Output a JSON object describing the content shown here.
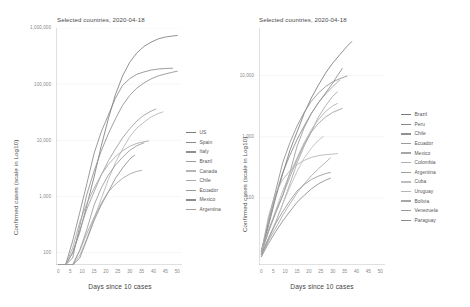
{
  "charts": [
    {
      "id": "left",
      "title": "Selected countries, 2020-04-18",
      "ylabel": "Confirmed cases (scale in Log10)",
      "xlabel": "Days since 10 cases",
      "legend_labels": [
        "US",
        "Spain",
        "Italy",
        "Brazil",
        "Canada",
        "Chile",
        "Ecuador",
        "Mexico",
        "Argentina"
      ]
    },
    {
      "id": "right",
      "title": "Selected countries, 2020-04-18",
      "ylabel": "Confirmed cases (scale in Log10)",
      "xlabel": "Days since 10 cases",
      "legend_labels": [
        "Brazil",
        "Peru",
        "Chile",
        "Ecuador",
        "Mexico",
        "Colombia",
        "Argentina",
        "Cuba",
        "Uruguay",
        "Bolivia",
        "Venezuela",
        "Paraguay"
      ]
    }
  ],
  "chart_data": [
    {
      "type": "line",
      "title": "Selected countries, 2020-04-18",
      "xlabel": "Days since 10 cases",
      "ylabel": "Confirmed cases (scale in Log10)",
      "yscale": "log10",
      "ylim": [
        60,
        1000000
      ],
      "xlim": [
        -1,
        52
      ],
      "ytick_labels": [
        "1,000,000",
        "100,000",
        "10,000",
        "1,000",
        "100"
      ],
      "ytick_values": [
        1000000,
        100000,
        10000,
        1000,
        100
      ],
      "xtick_labels": [
        "0",
        "5",
        "10",
        "15",
        "20",
        "25",
        "30",
        "35",
        "40",
        "45",
        "50"
      ],
      "xtick_values": [
        0,
        5,
        10,
        15,
        20,
        25,
        30,
        35,
        40,
        45,
        50
      ],
      "grid": true,
      "legend_position": "right",
      "series": [
        {
          "name": "US",
          "color": "#7d7d7d",
          "x": [
            0,
            3,
            6,
            9,
            12,
            15,
            18,
            21,
            24,
            27,
            30,
            33,
            36,
            39,
            42,
            45,
            48,
            50
          ],
          "y": [
            13,
            35,
            98,
            230,
            700,
            2200,
            7800,
            24000,
            65000,
            140000,
            245000,
            360000,
            470000,
            560000,
            640000,
            690000,
            720000,
            735000
          ]
        },
        {
          "name": "Spain",
          "color": "#8a8a8a",
          "x": [
            0,
            3,
            6,
            9,
            12,
            15,
            18,
            21,
            24,
            27,
            30,
            33,
            36,
            39,
            42,
            45,
            48
          ],
          "y": [
            13,
            45,
            160,
            520,
            1700,
            5800,
            14000,
            28000,
            56000,
            95000,
            125000,
            150000,
            165000,
            178000,
            186000,
            190000,
            192000
          ]
        },
        {
          "name": "Italy",
          "color": "#8f8f8f",
          "x": [
            0,
            3,
            6,
            9,
            12,
            15,
            18,
            21,
            24,
            27,
            30,
            33,
            36,
            39,
            42,
            45,
            48,
            50
          ],
          "y": [
            12,
            30,
            80,
            300,
            1100,
            2800,
            6400,
            13000,
            24000,
            42000,
            63000,
            85000,
            105000,
            124000,
            140000,
            152000,
            163000,
            170000
          ]
        },
        {
          "name": "Brazil",
          "color": "#9c9c9c",
          "x": [
            0,
            3,
            6,
            9,
            12,
            15,
            18,
            21,
            24,
            27,
            30,
            33,
            36,
            39,
            41
          ],
          "y": [
            14,
            35,
            100,
            250,
            600,
            1200,
            2400,
            4300,
            7000,
            11000,
            16000,
            22000,
            28000,
            33000,
            36000
          ]
        },
        {
          "name": "Canada",
          "color": "#b5b5b5",
          "x": [
            0,
            3,
            6,
            9,
            12,
            15,
            18,
            21,
            24,
            27,
            30,
            33,
            36,
            39,
            42,
            44
          ],
          "y": [
            11,
            22,
            45,
            90,
            180,
            400,
            900,
            2000,
            4000,
            7000,
            11500,
            16500,
            21000,
            26000,
            30000,
            32000
          ]
        },
        {
          "name": "Chile",
          "color": "#a8a8a8",
          "x": [
            0,
            3,
            6,
            9,
            12,
            15,
            18,
            21,
            24,
            27,
            30,
            33,
            36,
            38
          ],
          "y": [
            13,
            40,
            120,
            350,
            750,
            1400,
            2400,
            3700,
            5100,
            6500,
            7800,
            8800,
            9400,
            9700
          ]
        },
        {
          "name": "Ecuador",
          "color": "#9a9a9a",
          "x": [
            0,
            3,
            6,
            9,
            12,
            15,
            18,
            21,
            24,
            27,
            30,
            33,
            36
          ],
          "y": [
            14,
            30,
            58,
            110,
            260,
            700,
            1400,
            2400,
            3600,
            5000,
            6600,
            8000,
            9000
          ]
        },
        {
          "name": "Mexico",
          "color": "#8d8d8d",
          "x": [
            0,
            3,
            6,
            9,
            12,
            15,
            18,
            21,
            24,
            27,
            30,
            32
          ],
          "y": [
            12,
            22,
            40,
            80,
            170,
            370,
            700,
            1200,
            2100,
            3200,
            4600,
            5400
          ]
        },
        {
          "name": "Argentina",
          "color": "#a0a0a0",
          "x": [
            0,
            3,
            6,
            9,
            12,
            15,
            18,
            21,
            24,
            27,
            30,
            33,
            35
          ],
          "y": [
            13,
            28,
            56,
            110,
            220,
            420,
            750,
            1200,
            1650,
            2100,
            2500,
            2800,
            2900
          ]
        }
      ]
    },
    {
      "type": "line",
      "title": "Selected countries, 2020-04-18",
      "xlabel": "Days since 10 cases",
      "ylabel": "Confirmed cases (scale in Log10)",
      "yscale": "log10",
      "ylim": [
        8,
        60000
      ],
      "xlim": [
        -1,
        52
      ],
      "ytick_labels": [
        "10,000",
        "1,000",
        "100"
      ],
      "ytick_values": [
        10000,
        1000,
        100
      ],
      "xtick_labels": [
        "0",
        "5",
        "10",
        "15",
        "20",
        "25",
        "30",
        "35",
        "40",
        "45",
        "50"
      ],
      "xtick_values": [
        0,
        5,
        10,
        15,
        20,
        25,
        30,
        35,
        40,
        45,
        50
      ],
      "grid": true,
      "legend_position": "right",
      "series": [
        {
          "name": "Brazil",
          "color": "#7a7a7a",
          "x": [
            0,
            3,
            6,
            9,
            12,
            15,
            18,
            21,
            24,
            27,
            30,
            33,
            36,
            38
          ],
          "y": [
            14,
            35,
            100,
            250,
            600,
            1200,
            2400,
            4300,
            7000,
            11000,
            16000,
            22000,
            30000,
            36000
          ]
        },
        {
          "name": "Peru",
          "color": "#878787",
          "x": [
            0,
            3,
            6,
            9,
            12,
            15,
            18,
            21,
            24,
            27,
            30,
            32,
            34
          ],
          "y": [
            13,
            40,
            110,
            260,
            500,
            900,
            1500,
            2400,
            3600,
            5200,
            7500,
            10000,
            13000
          ]
        },
        {
          "name": "Chile",
          "color": "#909090",
          "x": [
            0,
            3,
            6,
            9,
            12,
            15,
            18,
            21,
            24,
            27,
            30,
            33,
            35,
            36
          ],
          "y": [
            13,
            45,
            130,
            380,
            800,
            1500,
            2500,
            3800,
            5200,
            6600,
            7900,
            8900,
            9500,
            9800
          ]
        },
        {
          "name": "Ecuador",
          "color": "#9b9b9b",
          "x": [
            0,
            3,
            6,
            9,
            12,
            15,
            18,
            21,
            24,
            27,
            30,
            32,
            33
          ],
          "y": [
            14,
            30,
            58,
            110,
            260,
            700,
            1400,
            2400,
            3600,
            5000,
            6600,
            7800,
            8500
          ]
        },
        {
          "name": "Mexico",
          "color": "#a5a5a5",
          "x": [
            0,
            3,
            6,
            9,
            12,
            15,
            18,
            21,
            24,
            27,
            30,
            32
          ],
          "y": [
            12,
            22,
            40,
            80,
            170,
            370,
            700,
            1200,
            2100,
            3200,
            4600,
            5400
          ]
        },
        {
          "name": "Colombia",
          "color": "#b0b0b0",
          "x": [
            0,
            3,
            6,
            9,
            12,
            15,
            18,
            21,
            24,
            27,
            30,
            32
          ],
          "y": [
            12,
            28,
            62,
            130,
            250,
            450,
            800,
            1300,
            1900,
            2600,
            3200,
            3500
          ]
        },
        {
          "name": "Argentina",
          "color": "#9e9e9e",
          "x": [
            0,
            3,
            6,
            9,
            12,
            15,
            18,
            21,
            24,
            27,
            30,
            33,
            34
          ],
          "y": [
            13,
            28,
            56,
            110,
            220,
            420,
            750,
            1200,
            1650,
            2100,
            2500,
            2800,
            2900
          ]
        },
        {
          "name": "Cuba",
          "color": "#bdbdbd",
          "x": [
            0,
            3,
            6,
            9,
            12,
            15,
            18,
            21,
            24,
            26
          ],
          "y": [
            11,
            20,
            40,
            80,
            150,
            270,
            450,
            650,
            880,
            1000
          ]
        },
        {
          "name": "Uruguay",
          "color": "#b4b4b4",
          "x": [
            0,
            3,
            6,
            9,
            12,
            15,
            18,
            21,
            24,
            27,
            30,
            32
          ],
          "y": [
            13,
            50,
            120,
            200,
            280,
            350,
            410,
            460,
            490,
            510,
            520,
            530
          ]
        },
        {
          "name": "Bolivia",
          "color": "#a7a7a7",
          "x": [
            0,
            3,
            6,
            9,
            12,
            15,
            18,
            21,
            24,
            27,
            29
          ],
          "y": [
            12,
            20,
            32,
            52,
            80,
            120,
            170,
            230,
            300,
            380,
            450
          ]
        },
        {
          "name": "Venezuela",
          "color": "#989898",
          "x": [
            0,
            3,
            6,
            9,
            12,
            15,
            18,
            21,
            24,
            27,
            29
          ],
          "y": [
            12,
            22,
            38,
            60,
            90,
            130,
            165,
            200,
            227,
            250,
            260
          ]
        },
        {
          "name": "Paraguay",
          "color": "#8b8b8b",
          "x": [
            0,
            3,
            6,
            9,
            12,
            15,
            18,
            21,
            24,
            27,
            29
          ],
          "y": [
            11,
            18,
            28,
            42,
            60,
            85,
            110,
            140,
            170,
            195,
            210
          ]
        }
      ]
    }
  ]
}
